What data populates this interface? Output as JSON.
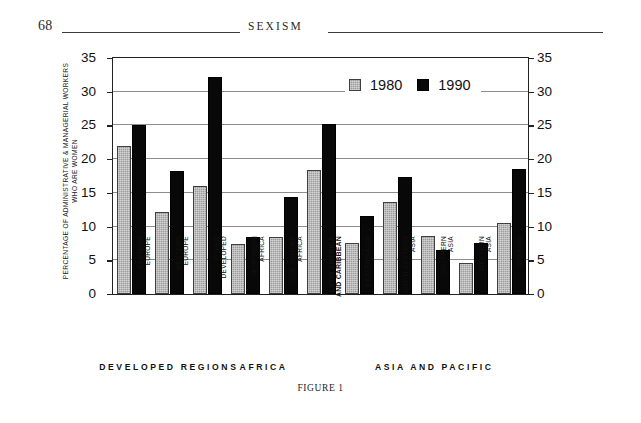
{
  "page": {
    "folio": "68",
    "running_head": "SEXISM",
    "caption": "FIGURE 1"
  },
  "chart_data": {
    "type": "bar",
    "title": "",
    "ylabel": "PERCENTAGE OF ADMINISTRATIVE &\nMANAGERIAL WORKERS WHO ARE WOMEN",
    "xlabel": "",
    "ylim": [
      0,
      35
    ],
    "yticks": [
      0,
      5,
      10,
      15,
      20,
      25,
      30,
      35
    ],
    "ytick_labels": [
      "0",
      "5",
      "10",
      "15",
      "20",
      "25",
      "30",
      "35"
    ],
    "dual_axis": true,
    "grid": true,
    "legend_position": "top-right",
    "categories": [
      "EASTERN\nEUROPE",
      "WESTERN\nEUROPE",
      "OTHER\nDEVELOPED",
      "NORTHERN\nAFRICA",
      "SUB-SAHARA\nAFRICA",
      "LATIN AMERICA\nAND CARIBBEAN",
      "EASTERN ASIA",
      "SOUTH-EASTERN\nASIA",
      "SOUTHERN\nASIA",
      "WESTERN\nASIA",
      "OCEANIA"
    ],
    "series": [
      {
        "name": "1980",
        "color": "#9d9d9d",
        "values": [
          22.0,
          12.2,
          16.0,
          7.4,
          8.5,
          18.4,
          7.5,
          13.6,
          8.6,
          4.6,
          10.5
        ]
      },
      {
        "name": "1990",
        "color": "#080808",
        "values": [
          25.1,
          18.2,
          32.2,
          8.5,
          14.4,
          25.2,
          11.6,
          17.4,
          6.5,
          7.5,
          18.5
        ]
      }
    ],
    "groups": [
      {
        "label": "DEVELOPED REGIONS",
        "categories": 3,
        "bold": false
      },
      {
        "label": "AFRICA",
        "categories": 2,
        "bold": false
      },
      {
        "label": "LATIN AMERICA\nAND CARIBBEAN",
        "categories": 1,
        "bold": true
      },
      {
        "label": "ASIA AND PACIFIC",
        "categories": 5,
        "bold": false
      }
    ]
  }
}
